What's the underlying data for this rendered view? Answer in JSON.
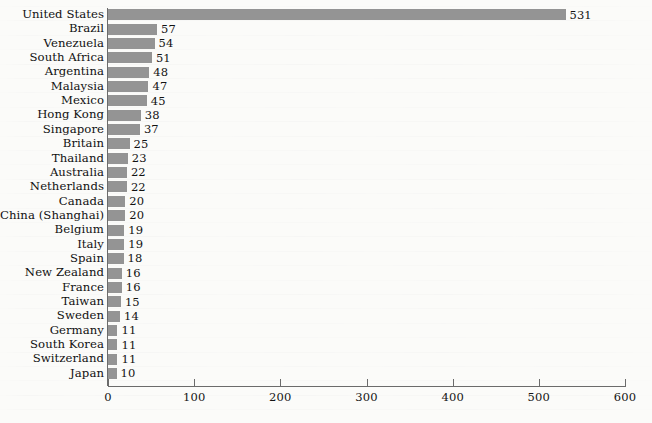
{
  "page": {
    "background_color": "#fbfbf9",
    "bar_color": "#949494",
    "axis_color": "#6b6b6b",
    "text_color": "#111111"
  },
  "chart_data": {
    "type": "bar",
    "orientation": "horizontal",
    "title": "",
    "subtitle": "",
    "xlabel": "",
    "ylabel": "",
    "xlim": [
      0,
      600
    ],
    "xticks": [
      0,
      100,
      200,
      300,
      400,
      500,
      600
    ],
    "xtick_labels": [
      "0",
      "100",
      "200",
      "300",
      "400",
      "500",
      "600"
    ],
    "grid": false,
    "legend": false,
    "value_labels": true,
    "categories": [
      "United States",
      "Brazil",
      "Venezuela",
      "South Africa",
      "Argentina",
      "Malaysia",
      "Mexico",
      "Hong Kong",
      "Singapore",
      "Britain",
      "Thailand",
      "Australia",
      "Netherlands",
      "Canada",
      "China (Shanghai)",
      "Belgium",
      "Italy",
      "Spain",
      "New Zealand",
      "France",
      "Taiwan",
      "Sweden",
      "Germany",
      "South Korea",
      "Switzerland",
      "Japan"
    ],
    "values": [
      531,
      57,
      54,
      51,
      48,
      47,
      45,
      38,
      37,
      25,
      23,
      22,
      22,
      20,
      20,
      19,
      19,
      18,
      16,
      16,
      15,
      14,
      11,
      11,
      11,
      10
    ],
    "value_label_texts": [
      "531",
      "57",
      "54",
      "51",
      "48",
      "47",
      "45",
      "38",
      "37",
      "25",
      "23",
      "22",
      "22",
      "20",
      "20",
      "19",
      "19",
      "18",
      "16",
      "16",
      "15",
      "14",
      "11",
      "11",
      "11",
      "10"
    ]
  }
}
